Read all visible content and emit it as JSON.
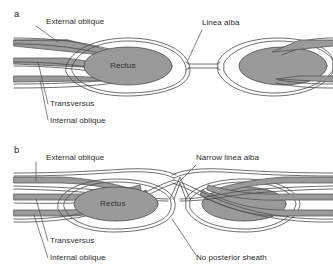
{
  "figure": {
    "title_text": "",
    "colors": {
      "muscle_fill": "#9a9a9a",
      "muscle_fill_light": "#b5b5b5",
      "line": "#4a4a4a",
      "text": "#2b2b2b",
      "background": "#ffffff"
    }
  },
  "panel_a": {
    "letter": "a",
    "labels": {
      "external_oblique": "External oblique",
      "linea_alba": "Linea alba",
      "transversus": "Transversus",
      "internal_oblique": "Internal oblique",
      "rectus": "Rectus"
    }
  },
  "panel_b": {
    "letter": "b",
    "labels": {
      "external_oblique": "External oblique",
      "narrow_linea_alba": "Narrow linea alba",
      "transversus": "Transversus",
      "internal_oblique": "Internal oblique",
      "no_posterior_sheath": "No posterior sheath",
      "rectus": "Rectus"
    }
  }
}
